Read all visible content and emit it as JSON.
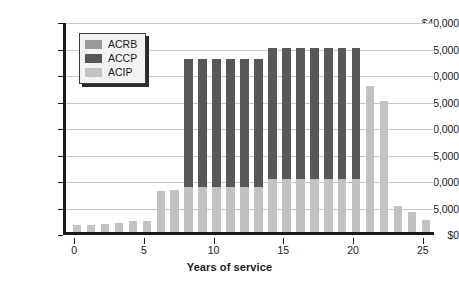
{
  "chart_data": {
    "type": "bar",
    "stacked": true,
    "title": "",
    "subtitle": "",
    "xlabel": "Years of service",
    "ylabel": "",
    "x": [
      0,
      1,
      2,
      3,
      4,
      5,
      6,
      7,
      8,
      9,
      10,
      11,
      12,
      13,
      14,
      15,
      16,
      17,
      18,
      19,
      20,
      21,
      22,
      23,
      24,
      25
    ],
    "xtick_labels": [
      "0",
      "5",
      "10",
      "15",
      "20",
      "25"
    ],
    "xticks": [
      0,
      5,
      10,
      15,
      20,
      25
    ],
    "xlim": [
      -0.8,
      25.8
    ],
    "ytick_labels": [
      "$0",
      "$5,000",
      "$10,000",
      "$15,000",
      "$20,000",
      "$25,000",
      "$30,000",
      "$35,000",
      "$40,000"
    ],
    "yticks": [
      0,
      5000,
      10000,
      15000,
      20000,
      25000,
      30000,
      35000,
      40000
    ],
    "ylim": [
      0,
      40000
    ],
    "grid": "horizontal",
    "legend_position": "upper-left-inside",
    "series": [
      {
        "name": "ACIP",
        "color": "#c2c2c2",
        "values": [
          1400,
          1400,
          1600,
          1700,
          2000,
          2100,
          7800,
          8000,
          8500,
          8500,
          8500,
          8500,
          8500,
          8500,
          10000,
          10000,
          10000,
          10000,
          10000,
          10000,
          10000,
          27500,
          24700,
          5000,
          3800,
          2300
        ]
      },
      {
        "name": "ACCP",
        "color": "#575757",
        "values": [
          0,
          0,
          0,
          0,
          0,
          0,
          0,
          0,
          24200,
          24200,
          24200,
          24200,
          24200,
          24200,
          24800,
          24800,
          24800,
          24800,
          24800,
          24800,
          24800,
          0,
          0,
          0,
          0,
          0
        ]
      },
      {
        "name": "ACRB",
        "color": "#9a9a9a",
        "values": [
          0,
          0,
          0,
          0,
          0,
          0,
          0,
          0,
          0,
          0,
          0,
          0,
          0,
          0,
          0,
          0,
          0,
          0,
          0,
          0,
          0,
          0,
          0,
          0,
          0,
          0
        ]
      }
    ],
    "totals": [
      1400,
      1400,
      1600,
      1700,
      2000,
      2100,
      7800,
      8000,
      32700,
      32700,
      32700,
      32700,
      32700,
      32700,
      34800,
      34800,
      34800,
      34800,
      34800,
      34800,
      34800,
      27500,
      24700,
      5000,
      3800,
      2300
    ]
  },
  "legend": {
    "items": [
      {
        "label": "ACRB",
        "color": "#9a9a9a"
      },
      {
        "label": "ACCP",
        "color": "#575757"
      },
      {
        "label": "ACIP",
        "color": "#c2c2c2"
      }
    ]
  },
  "axis": {
    "x_title": "Years of service"
  }
}
